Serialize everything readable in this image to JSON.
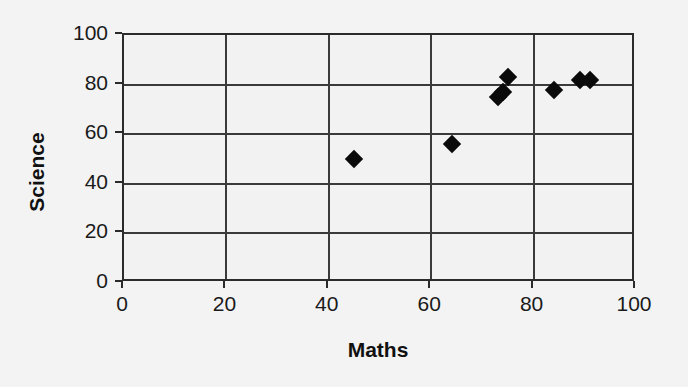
{
  "chart_data": {
    "type": "scatter",
    "title": "",
    "xlabel": "Maths",
    "ylabel": "Science",
    "xlim": [
      0,
      100
    ],
    "ylim": [
      0,
      100
    ],
    "xticks": [
      "0",
      "20",
      "40",
      "60",
      "80",
      "100"
    ],
    "yticks": [
      "0",
      "20",
      "40",
      "60",
      "80",
      "100"
    ],
    "xtick_values": [
      0,
      20,
      40,
      60,
      80,
      100
    ],
    "ytick_values": [
      0,
      20,
      40,
      60,
      80,
      100
    ],
    "grid": "both",
    "legend": "none",
    "marker": "diamond",
    "marker_color": "#0a0a0a",
    "plot_background": "#f2f2f2",
    "axis_color": "#2b2b2b",
    "gridline_color": "#3a3a3a",
    "series": [
      {
        "name": "Students",
        "points": [
          {
            "x": 45,
            "y": 50
          },
          {
            "x": 64,
            "y": 56
          },
          {
            "x": 73,
            "y": 75
          },
          {
            "x": 74,
            "y": 77
          },
          {
            "x": 75,
            "y": 83
          },
          {
            "x": 84,
            "y": 78
          },
          {
            "x": 89,
            "y": 82
          },
          {
            "x": 91,
            "y": 82
          }
        ]
      }
    ]
  }
}
